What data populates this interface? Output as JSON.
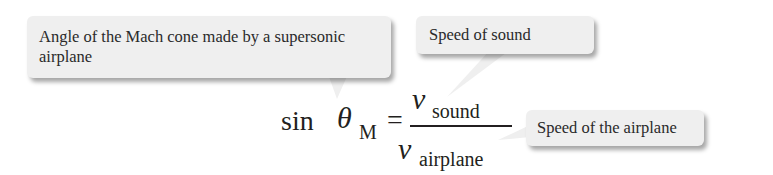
{
  "callouts": {
    "mach_angle": "Angle of the Mach cone made by a supersonic airplane",
    "sound_speed": "Speed of sound",
    "airplane_speed": "Speed of the airplane"
  },
  "equation": {
    "function": "sin",
    "angle_symbol": "θ",
    "angle_subscript": "M",
    "equals": "=",
    "numerator_symbol": "v",
    "numerator_subscript": "sound",
    "denominator_symbol": "v",
    "denominator_subscript": "airplane"
  },
  "colors": {
    "callout_fill": "#efefef",
    "text": "#231f20"
  }
}
